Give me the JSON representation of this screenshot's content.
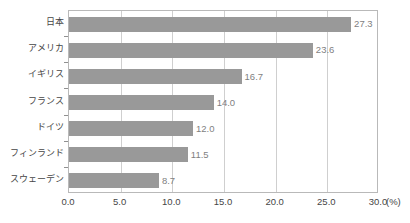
{
  "chart_data": {
    "type": "bar",
    "orientation": "horizontal",
    "title": "",
    "xlabel": "",
    "ylabel": "",
    "unit_label": "(%)",
    "xlim": [
      0.0,
      30.0
    ],
    "xticks": [
      0.0,
      5.0,
      10.0,
      15.0,
      20.0,
      25.0,
      30.0
    ],
    "xtick_labels": [
      "0.0",
      "5.0",
      "10.0",
      "15.0",
      "20.0",
      "25.0",
      "30.0"
    ],
    "grid": "vertical",
    "legend": "none",
    "categories": [
      "日本",
      "アメリカ",
      "イギリス",
      "フランス",
      "ドイツ",
      "フィンランド",
      "スウェーデン"
    ],
    "values": [
      27.3,
      23.6,
      16.7,
      14.0,
      12.0,
      11.5,
      8.7
    ],
    "value_labels": [
      "27.3",
      "23.6",
      "16.7",
      "14.0",
      "12.0",
      "11.5",
      "8.7"
    ],
    "bar_color": "#999999",
    "frame_color": "#b9b9b9",
    "grid_color": "#cfcfcf",
    "text_color": "#464646",
    "value_text_color": "#7f7f7f"
  }
}
